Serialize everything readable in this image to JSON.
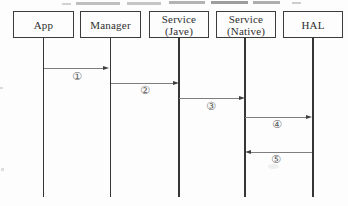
{
  "diagram": {
    "type": "sequence-diagram",
    "actors": [
      {
        "id": "app",
        "lines": [
          "App"
        ]
      },
      {
        "id": "manager",
        "lines": [
          "Manager"
        ]
      },
      {
        "id": "service-java",
        "lines": [
          "Service",
          "(Jave)"
        ]
      },
      {
        "id": "service-native",
        "lines": [
          "Service",
          "(Native)"
        ]
      },
      {
        "id": "hal",
        "lines": [
          "HAL"
        ]
      }
    ],
    "messages": [
      {
        "label": "①",
        "from": "App",
        "to": "Manager",
        "direction": "right"
      },
      {
        "label": "②",
        "from": "Manager",
        "to": "Service (Jave)",
        "direction": "right"
      },
      {
        "label": "③",
        "from": "Service (Jave)",
        "to": "Service (Native)",
        "direction": "right"
      },
      {
        "label": "④",
        "from": "Service (Native)",
        "to": "HAL",
        "direction": "right"
      },
      {
        "label": "⑤",
        "from": "HAL",
        "to": "Service (Native)",
        "direction": "left"
      }
    ],
    "colors": {
      "background": "#fdfdfd",
      "box_border": "#3c3c3c",
      "lifeline": "#363636",
      "message_line": "#7e7e7e",
      "arrowhead": "#3f3f3f",
      "text": "#2f2f2f",
      "label_text": "#5e5e5e"
    }
  }
}
